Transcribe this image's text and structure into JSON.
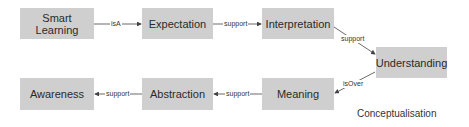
{
  "diagram": {
    "caption": "Conceptualisation",
    "colors": {
      "node_fill": "#cfcfcf",
      "node_text": "#2a2a2a",
      "edge": "#444444"
    },
    "nodes": {
      "smart_learning": {
        "label_line1": "Smart",
        "label_line2": "Learning"
      },
      "expectation": {
        "label": "Expectation"
      },
      "interpretation": {
        "label": "Interpretation"
      },
      "understanding": {
        "label": "Understanding"
      },
      "meaning": {
        "label": "Meaning"
      },
      "abstraction": {
        "label": "Abstraction"
      },
      "awareness": {
        "label": "Awareness"
      }
    },
    "edges": [
      {
        "from": "Smart Learning",
        "to": "Expectation",
        "label": "isA"
      },
      {
        "from": "Expectation",
        "to": "Interpretation",
        "label": "support"
      },
      {
        "from": "Interpretation",
        "to": "Understanding",
        "label": "support"
      },
      {
        "from": "Understanding",
        "to": "Meaning",
        "label": "isOver"
      },
      {
        "from": "Meaning",
        "to": "Abstraction",
        "label": "support"
      },
      {
        "from": "Abstraction",
        "to": "Awareness",
        "label": "support"
      }
    ]
  }
}
